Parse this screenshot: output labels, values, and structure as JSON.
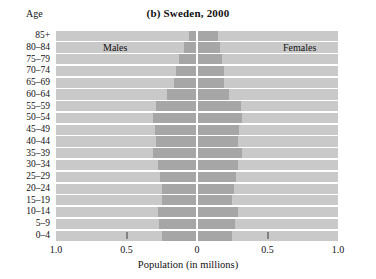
{
  "chart_data": {
    "type": "bar",
    "subtype": "population-pyramid",
    "title": "(b) Sweden, 2000",
    "xlabel": "Population (in millions)",
    "ylabel": "Age",
    "xlim": [
      -1.0,
      1.0
    ],
    "xticks": [
      1.0,
      0.5,
      0,
      0.5,
      1.0
    ],
    "xtick_labels": [
      "1.0",
      "0.5",
      "0",
      "0.5",
      "1.0"
    ],
    "grid": false,
    "legend_position": "inside-top",
    "categories": [
      "85+",
      "80–84",
      "75–79",
      "70–74",
      "65–69",
      "60–64",
      "55–59",
      "50–54",
      "45–49",
      "40–44",
      "35–39",
      "30–34",
      "25–29",
      "20–24",
      "15–19",
      "10–14",
      "5–9",
      "0–4"
    ],
    "series": [
      {
        "name": "Males",
        "side": "left",
        "values": [
          0.06,
          0.09,
          0.13,
          0.15,
          0.16,
          0.21,
          0.29,
          0.31,
          0.3,
          0.29,
          0.31,
          0.28,
          0.26,
          0.25,
          0.25,
          0.28,
          0.27,
          0.25
        ]
      },
      {
        "name": "Females",
        "side": "right",
        "values": [
          0.15,
          0.16,
          0.18,
          0.19,
          0.19,
          0.23,
          0.31,
          0.32,
          0.3,
          0.29,
          0.32,
          0.29,
          0.28,
          0.26,
          0.25,
          0.29,
          0.27,
          0.25
        ]
      }
    ],
    "colors": {
      "band": "#c9c9c9",
      "bar": "#a6a6a6",
      "zero_line": "#ffffff",
      "background": "#ffffff",
      "text": "#111111"
    }
  },
  "labels": {
    "age_header": "Age",
    "males": "Males",
    "females": "Females"
  }
}
